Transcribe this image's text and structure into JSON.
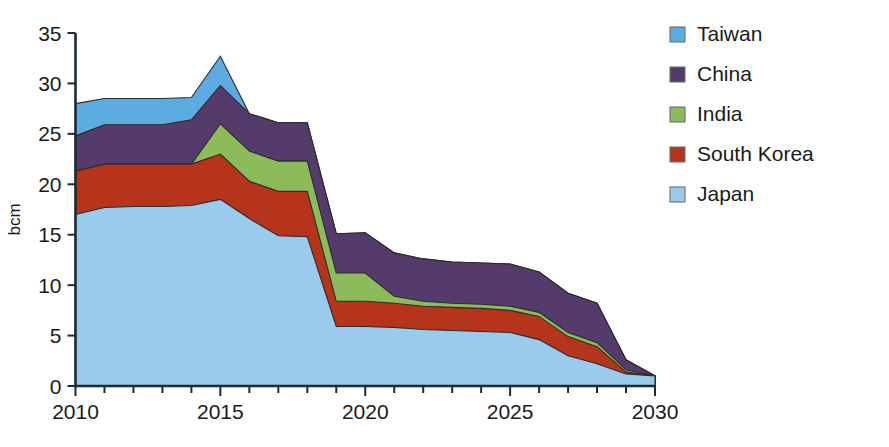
{
  "chart_data": {
    "type": "area",
    "stacked": true,
    "title": "",
    "subtitle": "",
    "xlabel": "",
    "ylabel": "bcm",
    "x": [
      2010,
      2011,
      2012,
      2013,
      2014,
      2015,
      2016,
      2017,
      2018,
      2019,
      2020,
      2021,
      2022,
      2023,
      2024,
      2025,
      2026,
      2027,
      2028,
      2029,
      2030
    ],
    "xtick_labels": [
      "2010",
      "2015",
      "2020",
      "2025",
      "2030"
    ],
    "xticks": [
      2010,
      2015,
      2020,
      2025,
      2030
    ],
    "xlim": [
      2010,
      2030
    ],
    "ytick_labels": [
      "0",
      "5",
      "10",
      "15",
      "20",
      "25",
      "30",
      "35"
    ],
    "yticks": [
      0,
      5,
      10,
      15,
      20,
      25,
      30,
      35
    ],
    "ylim": [
      0,
      35
    ],
    "grid": false,
    "legend_position": "right",
    "series": [
      {
        "name": "Japan",
        "color": "#9bcbec",
        "values": [
          17.0,
          17.7,
          17.8,
          17.8,
          17.9,
          18.5,
          16.6,
          14.9,
          14.8,
          5.9,
          5.9,
          5.8,
          5.6,
          5.5,
          5.4,
          5.3,
          4.6,
          3.0,
          2.2,
          1.2,
          1.0
        ]
      },
      {
        "name": "South Korea",
        "color": "#b5341b",
        "values": [
          4.3,
          4.3,
          4.2,
          4.2,
          4.1,
          4.5,
          3.7,
          4.4,
          4.5,
          2.5,
          2.5,
          2.4,
          2.3,
          2.3,
          2.3,
          2.2,
          2.3,
          1.9,
          1.7,
          0.2,
          0.0
        ]
      },
      {
        "name": "India",
        "color": "#8cbc5a",
        "values": [
          0.0,
          0.0,
          0.0,
          0.0,
          0.0,
          3.0,
          3.0,
          3.0,
          3.0,
          2.8,
          2.8,
          0.7,
          0.5,
          0.4,
          0.4,
          0.4,
          0.4,
          0.4,
          0.4,
          0.2,
          0.0
        ]
      },
      {
        "name": "China",
        "color": "#543b6b",
        "values": [
          3.5,
          3.9,
          3.9,
          3.9,
          4.4,
          3.8,
          3.7,
          3.8,
          3.8,
          3.9,
          4.0,
          4.3,
          4.2,
          4.1,
          4.1,
          4.2,
          4.0,
          3.9,
          3.9,
          1.0,
          0.0
        ]
      },
      {
        "name": "Taiwan",
        "color": "#5cace2",
        "values": [
          3.2,
          2.6,
          2.6,
          2.6,
          2.2,
          2.9,
          0.0,
          0.0,
          0.0,
          0.0,
          0.0,
          0.0,
          0.0,
          0.0,
          0.0,
          0.0,
          0.0,
          0.0,
          0.0,
          0.0,
          0.0
        ]
      }
    ],
    "stack_tops": {
      "Japan": [
        17.0,
        17.7,
        17.8,
        17.8,
        17.9,
        18.5,
        16.6,
        14.9,
        14.8,
        5.9,
        5.9,
        5.8,
        5.6,
        5.5,
        5.4,
        5.3,
        4.6,
        3.0,
        2.2,
        1.2,
        1.0
      ],
      "South Korea": [
        21.3,
        22.0,
        22.0,
        22.0,
        22.0,
        23.0,
        20.3,
        19.3,
        19.3,
        8.4,
        8.4,
        8.2,
        7.9,
        7.8,
        7.7,
        7.5,
        6.9,
        4.9,
        3.9,
        1.4,
        1.0
      ],
      "India": [
        21.3,
        22.0,
        22.0,
        22.0,
        22.0,
        26.0,
        23.3,
        22.3,
        22.3,
        11.2,
        11.2,
        8.9,
        8.4,
        8.2,
        8.1,
        7.9,
        7.3,
        5.3,
        4.3,
        1.6,
        1.0
      ],
      "China": [
        24.8,
        25.9,
        25.9,
        25.9,
        26.4,
        29.8,
        27.0,
        26.1,
        26.1,
        15.1,
        15.2,
        13.2,
        12.6,
        12.3,
        12.2,
        12.1,
        11.3,
        9.2,
        8.2,
        2.6,
        1.0
      ],
      "Taiwan": [
        28.0,
        28.5,
        28.5,
        28.5,
        28.6,
        32.7,
        27.0,
        26.1,
        26.1,
        15.1,
        15.2,
        13.2,
        12.6,
        12.3,
        12.2,
        12.1,
        11.3,
        9.2,
        8.2,
        2.6,
        1.0
      ]
    }
  },
  "legend": {
    "items": [
      {
        "label": "Taiwan",
        "color": "#5cace2"
      },
      {
        "label": "China",
        "color": "#543b6b"
      },
      {
        "label": "India",
        "color": "#8cbc5a"
      },
      {
        "label": "South Korea",
        "color": "#b5341b"
      },
      {
        "label": "Japan",
        "color": "#9bcbec"
      }
    ]
  },
  "axes": {
    "y_title": "bcm",
    "y_ticks": [
      "35",
      "30",
      "25",
      "20",
      "15",
      "10",
      "5",
      "0"
    ],
    "x_ticks": [
      "2010",
      "2015",
      "2020",
      "2025",
      "2030"
    ]
  }
}
